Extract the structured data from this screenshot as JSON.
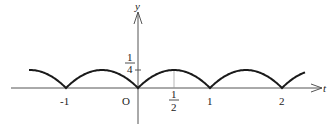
{
  "chart_data": {
    "type": "line",
    "title": "",
    "xlabel": "t",
    "ylabel": "y",
    "origin_label": "O",
    "x_ticks": [
      {
        "value": -1,
        "label": "-1"
      },
      {
        "value": 0.5,
        "label_num": "1",
        "label_den": "2"
      },
      {
        "value": 1,
        "label": "1"
      },
      {
        "value": 2,
        "label": "2"
      }
    ],
    "y_ticks": [
      {
        "value": 0.25,
        "label_num": "1",
        "label_den": "4"
      }
    ],
    "function": "y = |t - round(t)| * (1 - |t - round(t)|)  (periodic arches, zeros at integers, max 1/4 at half-integers)",
    "series": [
      {
        "name": "periodic arch",
        "x": [
          -1.5,
          -1,
          -0.5,
          0,
          0.5,
          1,
          1.5,
          2,
          2.3
        ],
        "y": [
          0.25,
          0,
          0.25,
          0,
          0.25,
          0,
          0.25,
          0,
          0.21
        ]
      }
    ],
    "xlim": [
      -1.75,
      2.55
    ],
    "ylim": [
      -0.45,
      1.05
    ],
    "grid": false,
    "legend": null
  }
}
